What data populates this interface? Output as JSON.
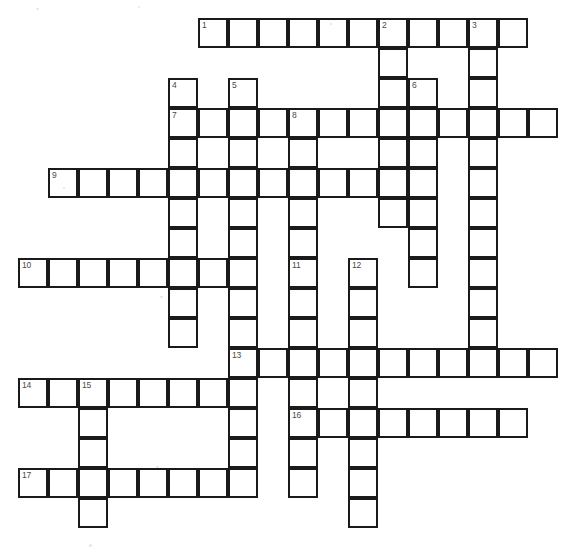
{
  "puzzle": {
    "title": "Crossword Puzzle Grid",
    "grid": {
      "cell_size": 30,
      "origin_x": 18,
      "origin_y": 18,
      "columns": 18,
      "rows": 17,
      "line_color": "#1a1a1a",
      "cell_color": "#ffffff",
      "number_color": "#4a4a4a",
      "background_color": "#ffffff"
    },
    "entries": [
      {
        "number": 1,
        "direction": "across",
        "row": 0,
        "col": 6,
        "length": 11
      },
      {
        "number": 2,
        "direction": "down",
        "row": 0,
        "col": 12,
        "length": 7
      },
      {
        "number": 3,
        "direction": "down",
        "row": 0,
        "col": 15,
        "length": 11
      },
      {
        "number": 4,
        "direction": "down",
        "row": 2,
        "col": 5,
        "length": 9
      },
      {
        "number": 5,
        "direction": "down",
        "row": 2,
        "col": 7,
        "length": 13
      },
      {
        "number": 6,
        "direction": "down",
        "row": 2,
        "col": 13,
        "length": 7
      },
      {
        "number": 7,
        "direction": "across",
        "row": 3,
        "col": 5,
        "length": 13
      },
      {
        "number": 8,
        "direction": "down",
        "row": 3,
        "col": 9,
        "length": 5
      },
      {
        "number": 9,
        "direction": "across",
        "row": 5,
        "col": 1,
        "length": 12
      },
      {
        "number": 10,
        "direction": "across",
        "row": 8,
        "col": 0,
        "length": 8
      },
      {
        "number": 11,
        "direction": "down",
        "row": 8,
        "col": 9,
        "length": 8
      },
      {
        "number": 12,
        "direction": "down",
        "row": 8,
        "col": 11,
        "length": 9
      },
      {
        "number": 13,
        "direction": "across",
        "row": 11,
        "col": 7,
        "length": 11
      },
      {
        "number": 14,
        "direction": "across",
        "row": 12,
        "col": 0,
        "length": 8
      },
      {
        "number": 15,
        "direction": "down",
        "row": 12,
        "col": 2,
        "length": 5
      },
      {
        "number": 16,
        "direction": "across",
        "row": 13,
        "col": 9,
        "length": 8
      },
      {
        "number": 17,
        "direction": "across",
        "row": 15,
        "col": 0,
        "length": 8
      }
    ],
    "numbered_cells": [
      {
        "number": 1,
        "row": 0,
        "col": 6
      },
      {
        "number": 2,
        "row": 0,
        "col": 12
      },
      {
        "number": 3,
        "row": 0,
        "col": 15
      },
      {
        "number": 4,
        "row": 2,
        "col": 5
      },
      {
        "number": 5,
        "row": 2,
        "col": 7
      },
      {
        "number": 6,
        "row": 2,
        "col": 13
      },
      {
        "number": 7,
        "row": 3,
        "col": 5
      },
      {
        "number": 8,
        "row": 3,
        "col": 9
      },
      {
        "number": 9,
        "row": 5,
        "col": 1
      },
      {
        "number": 10,
        "row": 8,
        "col": 0
      },
      {
        "number": 11,
        "row": 8,
        "col": 9
      },
      {
        "number": 12,
        "row": 8,
        "col": 11
      },
      {
        "number": 13,
        "row": 11,
        "col": 7
      },
      {
        "number": 14,
        "row": 12,
        "col": 0
      },
      {
        "number": 15,
        "row": 12,
        "col": 2
      },
      {
        "number": 16,
        "row": 13,
        "col": 9
      },
      {
        "number": 17,
        "row": 15,
        "col": 0
      }
    ],
    "specks": [
      {
        "x": 36,
        "y": 8,
        "w": 3,
        "h": 2
      },
      {
        "x": 138,
        "y": 6,
        "w": 2,
        "h": 2
      },
      {
        "x": 63,
        "y": 187,
        "w": 2,
        "h": 2
      },
      {
        "x": 160,
        "y": 296,
        "w": 3,
        "h": 2
      },
      {
        "x": 156,
        "y": 466,
        "w": 3,
        "h": 2
      },
      {
        "x": 89,
        "y": 544,
        "w": 3,
        "h": 3
      },
      {
        "x": 330,
        "y": 23,
        "w": 2,
        "h": 2
      }
    ]
  }
}
